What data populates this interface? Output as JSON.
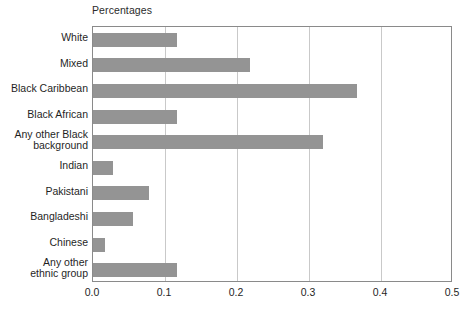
{
  "chart_data": {
    "type": "bar",
    "orientation": "horizontal",
    "title": "Percentages",
    "xlabel": "",
    "ylabel": "",
    "xlim": [
      0.0,
      0.5
    ],
    "grid": true,
    "legend": null,
    "categories": [
      "White",
      "Mixed",
      "Black Caribbean",
      "Black African",
      "Any other Black\nbackground",
      "Indian",
      "Pakistani",
      "Bangladeshi",
      "Chinese",
      "Any other\nethnic group"
    ],
    "values": [
      0.117,
      0.218,
      0.367,
      0.117,
      0.319,
      0.028,
      0.078,
      0.056,
      0.017,
      0.117
    ],
    "xticks": [
      "0.0",
      "0.1",
      "0.2",
      "0.3",
      "0.4",
      "0.5"
    ],
    "xtick_values": [
      0.0,
      0.1,
      0.2,
      0.3,
      0.4,
      0.5
    ],
    "bar_color": "#949494",
    "grid_color": "#c9c9c9",
    "frame_color": "#8a8a8a"
  }
}
